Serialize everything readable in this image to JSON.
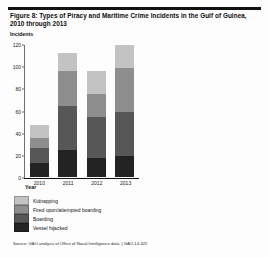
{
  "figure": {
    "title": "Figure 8: Types of Piracy and Maritime Crime Incidents in the Gulf of Guinea, 2010 through 2013",
    "source": "Source: GAO analysis of Office of Naval Intelligence data.  |  GAO-14-422"
  },
  "chart_data": {
    "type": "bar",
    "stacked": true,
    "title": "Figure 8: Types of Piracy and Maritime Crime Incidents in the Gulf of Guinea, 2010 through 2013",
    "xlabel": "Year",
    "ylabel": "Incidents",
    "categories": [
      "2010",
      "2011",
      "2012",
      "2013"
    ],
    "ylim": [
      0,
      120
    ],
    "yticks": [
      0,
      20,
      40,
      60,
      80,
      100,
      120
    ],
    "grid": false,
    "legend_position": "below-left",
    "stack_order_bottom_to_top": [
      "Vessel hijacked",
      "Boarding",
      "Fired upon/attempted boarding",
      "Kidnapping"
    ],
    "series": [
      {
        "name": "Kidnapping",
        "color": "#c3c3c3",
        "values": [
          12,
          16,
          21,
          21
        ]
      },
      {
        "name": "Fired upon/attempted boarding",
        "color": "#8e8e8e",
        "values": [
          9,
          32,
          21,
          40
        ]
      },
      {
        "name": "Boarding",
        "color": "#575757",
        "values": [
          13,
          40,
          37,
          40
        ]
      },
      {
        "name": "Vessel hijacked",
        "color": "#232323",
        "values": [
          13,
          24,
          17,
          19
        ]
      }
    ],
    "totals": [
      47,
      112,
      96,
      120
    ]
  }
}
